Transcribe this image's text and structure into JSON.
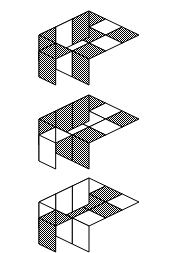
{
  "figure": {
    "title": "",
    "canvas": {
      "width": 178,
      "height": 253
    },
    "colors": {
      "outline": "#000000",
      "background": "#ffffff",
      "shaded_fill": "#808080",
      "plain_fill": "#ffffff",
      "texture": "checkerboard-dither-50"
    },
    "geometry": {
      "cell_half_width": 25.0,
      "cell_half_height": 12.0,
      "cube_height": 26.0,
      "protrusion_depth": 1
    },
    "blocks": [
      {
        "id": "block-1",
        "index": 1,
        "label": "Block 1",
        "origin": {
          "x": 89,
          "y": 11
        },
        "top_pattern": [
          [
            "shaded",
            "plain",
            "shaded"
          ],
          [
            "plain",
            "shaded",
            "plain"
          ],
          [
            "shaded",
            "plain",
            "shaded"
          ]
        ],
        "protruding_cube": {
          "row": 2,
          "col": 1,
          "top": "shaded",
          "left": "shaded",
          "right": "shaded"
        },
        "front_left_faces": [
          "shaded",
          "plain",
          "shaded"
        ],
        "front_right_faces": [
          "shaded",
          "plain",
          "shaded"
        ]
      },
      {
        "id": "block-2",
        "index": 2,
        "label": "Block 2",
        "origin": {
          "x": 89,
          "y": 95
        },
        "top_pattern": [
          [
            "shaded",
            "plain",
            "shaded"
          ],
          [
            "plain",
            "plain",
            "plain"
          ],
          [
            "shaded",
            "plain",
            "shaded"
          ]
        ],
        "protruding_cube": {
          "row": 2,
          "col": 1,
          "top": "plain",
          "left": "plain",
          "right": "plain"
        },
        "front_left_faces": [
          "shaded",
          "shaded",
          "shaded"
        ],
        "front_right_faces": [
          "shaded",
          "shaded",
          "shaded"
        ]
      },
      {
        "id": "block-3",
        "index": 3,
        "label": "Block 3",
        "origin": {
          "x": 89,
          "y": 178
        },
        "top_pattern": [
          [
            "plain",
            "shaded",
            "plain"
          ],
          [
            "shaded",
            "shaded",
            "shaded"
          ],
          [
            "plain",
            "shaded",
            "plain"
          ]
        ],
        "protruding_cube": {
          "row": 2,
          "col": 1,
          "top": "shaded",
          "left": "shaded",
          "right": "shaded"
        },
        "front_left_faces": [
          "plain",
          "plain",
          "plain"
        ],
        "front_right_faces": [
          "plain",
          "plain",
          "plain"
        ]
      }
    ]
  }
}
